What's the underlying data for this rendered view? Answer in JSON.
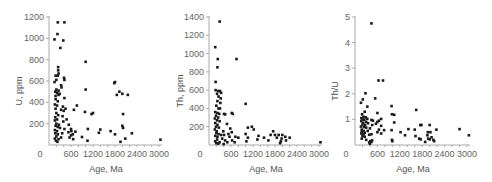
{
  "chart_data": [
    {
      "type": "scatter",
      "title": "",
      "xlabel": "Age, Ma",
      "ylabel": "U, ppm",
      "xlim": [
        0,
        3000
      ],
      "ylim": [
        0,
        1200
      ],
      "xticks": [
        0,
        600,
        1200,
        1800,
        2400,
        3000
      ],
      "yticks": [
        200,
        400,
        600,
        800,
        1000,
        1200
      ],
      "grid": false,
      "points": [
        [
          240,
          1150
        ],
        [
          420,
          1150
        ],
        [
          230,
          1040
        ],
        [
          150,
          990
        ],
        [
          390,
          980
        ],
        [
          310,
          910
        ],
        [
          1000,
          780
        ],
        [
          250,
          730
        ],
        [
          250,
          700
        ],
        [
          260,
          670
        ],
        [
          180,
          650
        ],
        [
          240,
          650
        ],
        [
          200,
          610
        ],
        [
          410,
          630
        ],
        [
          420,
          610
        ],
        [
          150,
          590
        ],
        [
          330,
          560
        ],
        [
          340,
          540
        ],
        [
          200,
          520
        ],
        [
          260,
          510
        ],
        [
          1000,
          520
        ],
        [
          170,
          500
        ],
        [
          220,
          490
        ],
        [
          290,
          480
        ],
        [
          180,
          460
        ],
        [
          260,
          470
        ],
        [
          1800,
          590
        ],
        [
          1780,
          580
        ],
        [
          1920,
          500
        ],
        [
          2000,
          480
        ],
        [
          1850,
          470
        ],
        [
          2150,
          470
        ],
        [
          420,
          440
        ],
        [
          180,
          430
        ],
        [
          240,
          410
        ],
        [
          160,
          380
        ],
        [
          220,
          370
        ],
        [
          380,
          360
        ],
        [
          760,
          370
        ],
        [
          450,
          340
        ],
        [
          180,
          340
        ],
        [
          330,
          330
        ],
        [
          680,
          330
        ],
        [
          400,
          320
        ],
        [
          980,
          310
        ],
        [
          1200,
          300
        ],
        [
          1160,
          290
        ],
        [
          2020,
          290
        ],
        [
          200,
          300
        ],
        [
          250,
          280
        ],
        [
          370,
          270
        ],
        [
          170,
          260
        ],
        [
          220,
          240
        ],
        [
          480,
          240
        ],
        [
          160,
          230
        ],
        [
          390,
          220
        ],
        [
          200,
          200
        ],
        [
          270,
          190
        ],
        [
          540,
          190
        ],
        [
          180,
          180
        ],
        [
          240,
          170
        ],
        [
          300,
          160
        ],
        [
          2000,
          180
        ],
        [
          2020,
          160
        ],
        [
          420,
          150
        ],
        [
          600,
          150
        ],
        [
          1060,
          150
        ],
        [
          1400,
          145
        ],
        [
          1680,
          130
        ],
        [
          160,
          140
        ],
        [
          220,
          130
        ],
        [
          610,
          130
        ],
        [
          720,
          125
        ],
        [
          530,
          120
        ],
        [
          1360,
          115
        ],
        [
          360,
          110
        ],
        [
          170,
          110
        ],
        [
          240,
          100
        ],
        [
          650,
          100
        ],
        [
          1800,
          100
        ],
        [
          2260,
          110
        ],
        [
          600,
          90
        ],
        [
          200,
          80
        ],
        [
          330,
          70
        ],
        [
          560,
          70
        ],
        [
          900,
          75
        ],
        [
          2080,
          60
        ],
        [
          160,
          60
        ],
        [
          260,
          55
        ],
        [
          660,
          55
        ],
        [
          1050,
          40
        ],
        [
          1950,
          30
        ],
        [
          3040,
          50
        ],
        [
          190,
          40
        ],
        [
          230,
          30
        ]
      ]
    },
    {
      "type": "scatter",
      "title": "",
      "xlabel": "Age, Ma",
      "ylabel": "Th, ppm",
      "xlim": [
        0,
        3000
      ],
      "ylim": [
        0,
        1400
      ],
      "xticks": [
        0,
        600,
        1200,
        1800,
        2400,
        3000
      ],
      "yticks": [
        200,
        400,
        600,
        800,
        1000,
        1200,
        1400
      ],
      "grid": false,
      "points": [
        [
          290,
          1350
        ],
        [
          170,
          1070
        ],
        [
          240,
          940
        ],
        [
          750,
          940
        ],
        [
          230,
          850
        ],
        [
          180,
          690
        ],
        [
          180,
          600
        ],
        [
          250,
          590
        ],
        [
          300,
          590
        ],
        [
          330,
          570
        ],
        [
          220,
          560
        ],
        [
          260,
          530
        ],
        [
          320,
          510
        ],
        [
          230,
          480
        ],
        [
          310,
          460
        ],
        [
          1000,
          450
        ],
        [
          200,
          430
        ],
        [
          260,
          400
        ],
        [
          300,
          400
        ],
        [
          170,
          360
        ],
        [
          230,
          350
        ],
        [
          280,
          340
        ],
        [
          620,
          350
        ],
        [
          410,
          340
        ],
        [
          440,
          335
        ],
        [
          650,
          340
        ],
        [
          190,
          320
        ],
        [
          250,
          300
        ],
        [
          160,
          290
        ],
        [
          220,
          270
        ],
        [
          290,
          260
        ],
        [
          170,
          240
        ],
        [
          230,
          220
        ],
        [
          490,
          230
        ],
        [
          190,
          200
        ],
        [
          270,
          190
        ],
        [
          1060,
          190
        ],
        [
          1170,
          200
        ],
        [
          580,
          180
        ],
        [
          1220,
          170
        ],
        [
          160,
          170
        ],
        [
          210,
          150
        ],
        [
          390,
          150
        ],
        [
          620,
          140
        ],
        [
          1750,
          150
        ],
        [
          1680,
          110
        ],
        [
          1800,
          110
        ],
        [
          200,
          130
        ],
        [
          260,
          120
        ],
        [
          330,
          110
        ],
        [
          410,
          110
        ],
        [
          530,
          120
        ],
        [
          1000,
          120
        ],
        [
          1900,
          110
        ],
        [
          2000,
          110
        ],
        [
          2080,
          90
        ],
        [
          2200,
          80
        ],
        [
          1350,
          100
        ],
        [
          1500,
          80
        ],
        [
          170,
          100
        ],
        [
          230,
          90
        ],
        [
          560,
          90
        ],
        [
          720,
          90
        ],
        [
          1060,
          80
        ],
        [
          1850,
          80
        ],
        [
          1980,
          70
        ],
        [
          360,
          70
        ],
        [
          800,
          80
        ],
        [
          1320,
          60
        ],
        [
          1620,
          50
        ],
        [
          220,
          60
        ],
        [
          440,
          50
        ],
        [
          630,
          50
        ],
        [
          1020,
          40
        ],
        [
          1960,
          40
        ],
        [
          2100,
          50
        ],
        [
          170,
          40
        ],
        [
          290,
          30
        ],
        [
          500,
          30
        ],
        [
          700,
          30
        ],
        [
          1940,
          20
        ],
        [
          3040,
          30
        ],
        [
          200,
          20
        ],
        [
          250,
          15
        ],
        [
          400,
          10
        ]
      ]
    },
    {
      "type": "scatter",
      "title": "",
      "xlabel": "Age, Ma",
      "ylabel": "Th/U",
      "xlim": [
        0,
        3000
      ],
      "ylim": [
        0,
        5
      ],
      "xticks": [
        0,
        600,
        1200,
        1800,
        2400,
        3000
      ],
      "yticks": [
        1,
        2,
        3,
        4,
        5
      ],
      "grid": false,
      "points": [
        [
          440,
          4.75
        ],
        [
          630,
          2.52
        ],
        [
          750,
          2.52
        ],
        [
          280,
          2.02
        ],
        [
          540,
          1.82
        ],
        [
          210,
          1.78
        ],
        [
          160,
          1.65
        ],
        [
          980,
          1.52
        ],
        [
          330,
          1.5
        ],
        [
          1640,
          1.37
        ],
        [
          260,
          1.3
        ],
        [
          600,
          1.25
        ],
        [
          190,
          1.2
        ],
        [
          990,
          1.2
        ],
        [
          1050,
          1.18
        ],
        [
          230,
          1.1
        ],
        [
          290,
          1.08
        ],
        [
          170,
          1.05
        ],
        [
          330,
          1.02
        ],
        [
          700,
          1.02
        ],
        [
          200,
          1.0
        ],
        [
          250,
          0.98
        ],
        [
          440,
          0.98
        ],
        [
          480,
          0.95
        ],
        [
          640,
          0.95
        ],
        [
          170,
          0.93
        ],
        [
          300,
          0.9
        ],
        [
          600,
          0.9
        ],
        [
          1050,
          0.88
        ],
        [
          220,
          0.86
        ],
        [
          350,
          0.85
        ],
        [
          560,
          0.83
        ],
        [
          200,
          0.8
        ],
        [
          270,
          0.78
        ],
        [
          460,
          0.78
        ],
        [
          700,
          0.75
        ],
        [
          1750,
          0.78
        ],
        [
          2000,
          0.78
        ],
        [
          1780,
          0.78
        ],
        [
          1430,
          0.62
        ],
        [
          2180,
          0.6
        ],
        [
          2800,
          0.62
        ],
        [
          160,
          0.72
        ],
        [
          240,
          0.7
        ],
        [
          300,
          0.68
        ],
        [
          400,
          0.65
        ],
        [
          640,
          0.6
        ],
        [
          780,
          0.58
        ],
        [
          980,
          0.58
        ],
        [
          1600,
          0.6
        ],
        [
          180,
          0.6
        ],
        [
          230,
          0.55
        ],
        [
          340,
          0.55
        ],
        [
          600,
          0.5
        ],
        [
          180,
          0.5
        ],
        [
          260,
          0.48
        ],
        [
          1220,
          0.5
        ],
        [
          1950,
          0.5
        ],
        [
          2020,
          0.5
        ],
        [
          170,
          0.45
        ],
        [
          230,
          0.42
        ],
        [
          380,
          0.4
        ],
        [
          440,
          0.42
        ],
        [
          700,
          0.45
        ],
        [
          1340,
          0.38
        ],
        [
          1940,
          0.38
        ],
        [
          3050,
          0.38
        ],
        [
          200,
          0.35
        ],
        [
          260,
          0.32
        ],
        [
          1620,
          0.35
        ],
        [
          2050,
          0.3
        ],
        [
          1720,
          0.25
        ],
        [
          1760,
          0.22
        ],
        [
          1960,
          0.25
        ],
        [
          2000,
          0.22
        ],
        [
          2100,
          0.2
        ],
        [
          180,
          0.25
        ],
        [
          300,
          0.2
        ],
        [
          990,
          0.2
        ],
        [
          1000,
          0.15
        ],
        [
          1880,
          0.12
        ],
        [
          2120,
          0.15
        ],
        [
          410,
          0.15
        ],
        [
          440,
          0.12
        ],
        [
          460,
          0.18
        ],
        [
          380,
          0.1
        ],
        [
          400,
          0.05
        ]
      ]
    }
  ]
}
